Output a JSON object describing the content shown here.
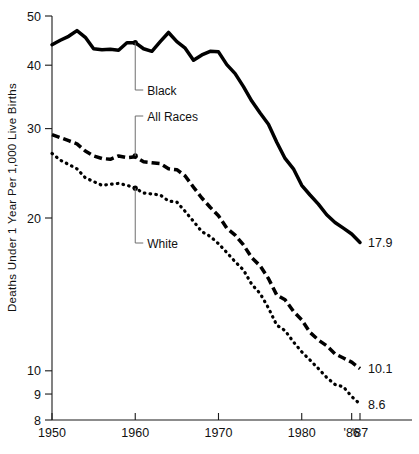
{
  "chart_data": {
    "type": "line",
    "title": "",
    "xlabel": "",
    "ylabel": "Deaths Under 1 Year Per 1,000 Live Births",
    "yscale": "log",
    "ylim": [
      8,
      50
    ],
    "xlim": [
      1950,
      1987
    ],
    "grid": false,
    "legend_position": "inline-annotations",
    "ytick_labels": [
      "50",
      "40",
      "30",
      "20",
      "10",
      "9",
      "8"
    ],
    "ytick_values": [
      50,
      40,
      30,
      20,
      10,
      9,
      8
    ],
    "xtick_labels": [
      "1950",
      "1960",
      "1970",
      "1980",
      "'86",
      "'87"
    ],
    "xtick_values": [
      1950,
      1960,
      1970,
      1980,
      1986,
      1987
    ],
    "x": [
      1950,
      1951,
      1952,
      1953,
      1954,
      1955,
      1956,
      1957,
      1958,
      1959,
      1960,
      1961,
      1962,
      1963,
      1964,
      1965,
      1966,
      1967,
      1968,
      1969,
      1970,
      1971,
      1972,
      1973,
      1974,
      1975,
      1976,
      1977,
      1978,
      1979,
      1980,
      1981,
      1982,
      1983,
      1984,
      1985,
      1986,
      1987
    ],
    "series": [
      {
        "name": "Black",
        "style": "solid",
        "end_value": 17.9,
        "end_label": "17.9",
        "annotation_label": "Black",
        "annotation_year": 1960,
        "annotation_value": 44.3,
        "values": [
          43.9,
          44.8,
          45.6,
          46.8,
          45.4,
          43.1,
          42.9,
          43.0,
          42.8,
          44.3,
          44.3,
          43.1,
          42.6,
          44.5,
          46.4,
          44.5,
          43.2,
          40.9,
          41.9,
          42.6,
          42.5,
          40.1,
          38.5,
          36.3,
          34.0,
          32.2,
          30.6,
          28.2,
          26.2,
          25.0,
          23.2,
          22.2,
          21.3,
          20.3,
          19.6,
          19.1,
          18.6,
          17.9
        ]
      },
      {
        "name": "All Races",
        "style": "dashed",
        "end_value": 10.1,
        "end_label": "10.1",
        "annotation_label": "All Races",
        "annotation_year": 1960,
        "annotation_value": 26.5,
        "values": [
          29.2,
          28.8,
          28.4,
          28.0,
          27.1,
          26.5,
          26.2,
          26.1,
          26.5,
          26.3,
          26.4,
          25.8,
          25.7,
          25.6,
          25.0,
          24.9,
          24.2,
          23.0,
          21.9,
          21.0,
          20.2,
          19.1,
          18.5,
          17.7,
          16.7,
          16.1,
          15.2,
          14.1,
          13.8,
          13.1,
          12.6,
          11.9,
          11.5,
          11.2,
          10.8,
          10.6,
          10.4,
          10.1
        ]
      },
      {
        "name": "White",
        "style": "dotted",
        "end_value": 8.6,
        "end_label": "8.6",
        "annotation_label": "White",
        "annotation_year": 1960,
        "annotation_value": 22.9,
        "values": [
          26.8,
          26.0,
          25.5,
          25.0,
          24.0,
          23.6,
          23.2,
          23.3,
          23.4,
          23.2,
          22.9,
          22.4,
          22.3,
          22.2,
          21.6,
          21.5,
          20.6,
          19.7,
          18.8,
          18.4,
          17.8,
          17.1,
          16.4,
          15.8,
          14.8,
          14.2,
          13.3,
          12.3,
          12.0,
          11.4,
          10.9,
          10.5,
          10.1,
          9.7,
          9.4,
          9.3,
          8.9,
          8.6
        ]
      }
    ]
  }
}
